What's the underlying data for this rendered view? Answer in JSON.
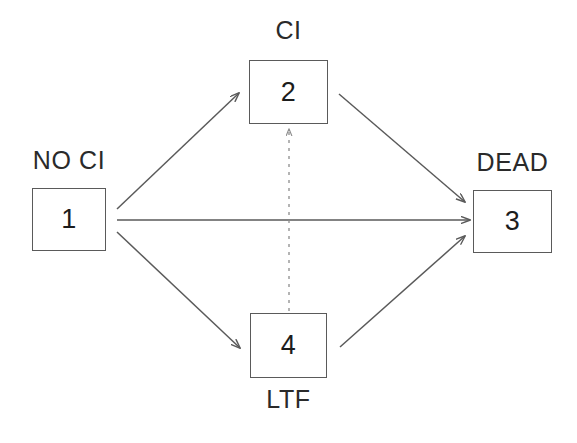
{
  "diagram": {
    "type": "state-transition-diagram",
    "background_color": "#ffffff",
    "stroke_color": "#5a5a5a",
    "text_color": "#1c1c1c",
    "width": 577,
    "height": 443,
    "states": [
      {
        "id": "state-1",
        "number": "1",
        "label": "NO CI",
        "label_position": "above",
        "box": {
          "x": 32,
          "y": 188,
          "w": 74,
          "h": 63
        },
        "label_pos": {
          "x": 32,
          "y": 146,
          "w": 74
        }
      },
      {
        "id": "state-2",
        "number": "2",
        "label": "CI",
        "label_position": "above",
        "box": {
          "x": 249,
          "y": 60,
          "w": 79,
          "h": 64
        },
        "label_pos": {
          "x": 249,
          "y": 16,
          "w": 79
        }
      },
      {
        "id": "state-3",
        "number": "3",
        "label": "DEAD",
        "label_position": "above",
        "box": {
          "x": 473,
          "y": 190,
          "w": 79,
          "h": 63
        },
        "label_pos": {
          "x": 455,
          "y": 148,
          "w": 115
        }
      },
      {
        "id": "state-4",
        "number": "4",
        "label": "LTF",
        "label_position": "below",
        "box": {
          "x": 250,
          "y": 313,
          "w": 77,
          "h": 65
        },
        "label_pos": {
          "x": 250,
          "y": 385,
          "w": 77
        }
      }
    ],
    "transitions": [
      {
        "id": "edge-1-2",
        "from": "1",
        "to": "2",
        "style": "solid",
        "x1": 117,
        "y1": 209,
        "x2": 239,
        "y2": 93
      },
      {
        "id": "edge-1-3",
        "from": "1",
        "to": "3",
        "style": "solid",
        "x1": 117,
        "y1": 220,
        "x2": 470,
        "y2": 220
      },
      {
        "id": "edge-1-4",
        "from": "1",
        "to": "4",
        "style": "solid",
        "x1": 117,
        "y1": 232,
        "x2": 240,
        "y2": 348
      },
      {
        "id": "edge-2-3",
        "from": "2",
        "to": "3",
        "style": "solid",
        "x1": 339,
        "y1": 94,
        "x2": 465,
        "y2": 202
      },
      {
        "id": "edge-4-3",
        "from": "4",
        "to": "3",
        "style": "solid",
        "x1": 340,
        "y1": 347,
        "x2": 465,
        "y2": 236
      },
      {
        "id": "edge-4-2",
        "from": "4",
        "to": "2",
        "style": "dashed",
        "x1": 289,
        "y1": 311,
        "x2": 289,
        "y2": 129
      }
    ]
  }
}
